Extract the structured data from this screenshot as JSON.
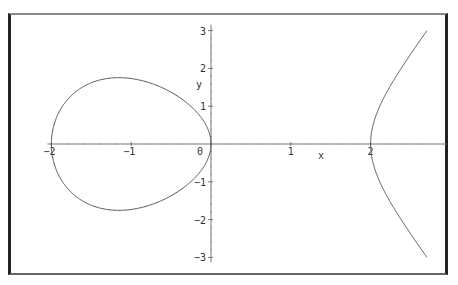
{
  "chart_data": {
    "type": "line",
    "title": "",
    "xlabel": "x",
    "ylabel": "y",
    "equation": "y^2 = x^3 - 4x",
    "xlim": [
      -2.0,
      2.75
    ],
    "ylim": [
      -3.0,
      3.0
    ],
    "x_ticks": [
      "-2",
      "-1",
      "0",
      "1",
      "2"
    ],
    "y_ticks": [
      "-3",
      "-2",
      "-1",
      "1",
      "2",
      "3"
    ],
    "grid": false,
    "legend": null,
    "series": [
      {
        "name": "oval",
        "description": "closed loop from x=-2 to x=0, max |y| ≈ 1.75 at x ≈ -1.15"
      },
      {
        "name": "unbounded-branch",
        "description": "branch from vertex (2,0) opening right, reaching y ≈ ±3 at x ≈ 2.7"
      }
    ],
    "color": "#555555"
  },
  "axes": {
    "x_label": "x",
    "y_label": "y"
  }
}
